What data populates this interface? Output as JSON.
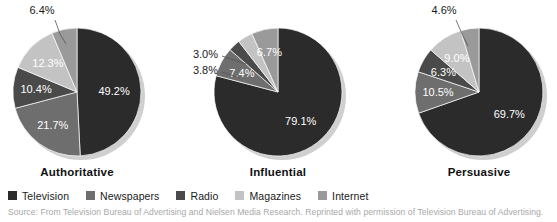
{
  "figure": {
    "title": "",
    "source": "Source: From Television Bureau of Advertising and Nielsen Media Research. Reprinted with permission of Television Bureau of Advertising."
  },
  "legend": {
    "position": "bottom-left",
    "items": [
      {
        "label": "Television",
        "color": "#2b2b2b"
      },
      {
        "label": "Newspapers",
        "color": "#6e6e6e"
      },
      {
        "label": "Radio",
        "color": "#4a4a4a"
      },
      {
        "label": "Magazines",
        "color": "#c3c3c3"
      },
      {
        "label": "Internet",
        "color": "#9a9a9a"
      }
    ]
  },
  "chart_data": [
    {
      "type": "pie",
      "title": "Authoritative",
      "categories": [
        "Television",
        "Newspapers",
        "Radio",
        "Magazines",
        "Internet"
      ],
      "values": [
        49.2,
        21.7,
        10.4,
        12.3,
        6.4
      ],
      "labels": [
        "49.2%",
        "21.7%",
        "10.4%",
        "12.3%",
        "6.4%"
      ],
      "colors": [
        "#2b2b2b",
        "#6e6e6e",
        "#4a4a4a",
        "#c3c3c3",
        "#9a9a9a"
      ],
      "label_placement": [
        "inside",
        "inside",
        "inside",
        "inside",
        "outside"
      ],
      "start_angle_deg": 0,
      "direction": "clockwise",
      "legend": "shared",
      "grid": false
    },
    {
      "type": "pie",
      "title": "Influential",
      "categories": [
        "Television",
        "Newspapers",
        "Radio",
        "Magazines",
        "Internet"
      ],
      "values": [
        79.1,
        7.4,
        3.0,
        3.8,
        6.7
      ],
      "labels": [
        "79.1%",
        "7.4%",
        "3.0%",
        "3.8%",
        "6.7%"
      ],
      "colors": [
        "#2b2b2b",
        "#6e6e6e",
        "#4a4a4a",
        "#c3c3c3",
        "#9a9a9a"
      ],
      "label_placement": [
        "inside",
        "inside",
        "outside",
        "outside",
        "inside"
      ],
      "start_angle_deg": 0,
      "direction": "clockwise",
      "legend": "shared",
      "grid": false
    },
    {
      "type": "pie",
      "title": "Persuasive",
      "categories": [
        "Television",
        "Newspapers",
        "Radio",
        "Magazines",
        "Internet"
      ],
      "values": [
        69.7,
        10.5,
        6.3,
        9.0,
        4.6
      ],
      "labels": [
        "69.7%",
        "10.5%",
        "6.3%",
        "9.0%",
        "4.6%"
      ],
      "colors": [
        "#2b2b2b",
        "#6e6e6e",
        "#4a4a4a",
        "#c3c3c3",
        "#9a9a9a"
      ],
      "label_placement": [
        "inside",
        "inside",
        "inside",
        "inside",
        "outside"
      ],
      "start_angle_deg": 0,
      "direction": "clockwise",
      "legend": "shared",
      "grid": false
    }
  ]
}
